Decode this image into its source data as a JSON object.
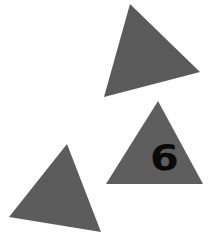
{
  "canvas": {
    "width": 211,
    "height": 232,
    "background": "#ffffff"
  },
  "shapes": [
    {
      "name": "triangle-top",
      "fill": "#5a5a5a",
      "points": "130,4 200,72 104,97"
    },
    {
      "name": "triangle-right",
      "fill": "#5e5e5e",
      "points": "158,101 203,184 106,184"
    },
    {
      "name": "triangle-bottom-left",
      "fill": "#5c5c5c",
      "points": "67,144 9,217 101,232"
    }
  ],
  "labels": {
    "number": "6",
    "number_color": "#0a0a0a"
  }
}
